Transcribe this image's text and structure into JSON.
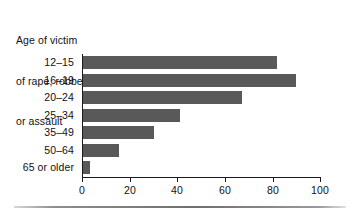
{
  "chart_data": {
    "type": "bar",
    "orientation": "horizontal",
    "title": "Age of victim of rape, robbery, or assault",
    "title_lines": [
      "Age of victim",
      "of rape, robbery,",
      "or assault"
    ],
    "categories": [
      "12–15",
      "16–19",
      "20–24",
      "25–34",
      "35–49",
      "50–64",
      "65 or older"
    ],
    "values": [
      82,
      90,
      67,
      41,
      30,
      15,
      3
    ],
    "xlabel": "",
    "ylabel": "",
    "xlim": [
      0,
      100
    ],
    "xticks": [
      0,
      20,
      40,
      60,
      80,
      100
    ],
    "xtick_labels": [
      "0",
      "20",
      "40",
      "60",
      "80",
      "100"
    ],
    "grid": false,
    "legend": null,
    "bar_color": "#595959",
    "axis_color": "#1a1a1a",
    "text_color": "#111111",
    "background": "#ffffff"
  }
}
